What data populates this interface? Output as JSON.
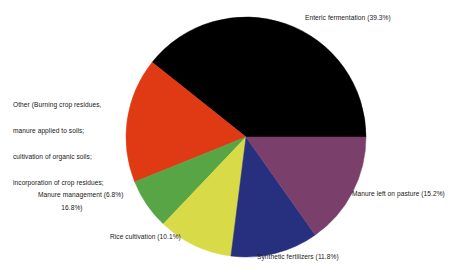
{
  "chart_data": {
    "type": "pie",
    "title": "",
    "subtitle": "",
    "xlabel": "",
    "ylabel": "",
    "legend_position": "none",
    "grid": false,
    "units": "percent",
    "start_angle_deg": 0,
    "direction": "counterclockwise",
    "categories": [
      "Enteric fermentation",
      "Other (Burning crop residues, manure applied to soils; cultivation of organic soils; incorporation of crop residues;",
      "Manure management",
      "Rice cultivation",
      "Synthetic fertilizers",
      "Manure left on pasture"
    ],
    "values": [
      39.3,
      16.8,
      6.8,
      10.1,
      11.8,
      15.2
    ],
    "colors": [
      "#000000",
      "#e03a14",
      "#57a544",
      "#d8db47",
      "#27307e",
      "#7b3f6b"
    ],
    "slices": [
      {
        "name": "enteric-fermentation",
        "label": "Enteric fermentation (39.3%)",
        "value": 39.3,
        "value_text": "39.3%",
        "color": "#000000"
      },
      {
        "name": "other",
        "label": "Other (Burning crop residues, manure applied to soils; cultivation of organic soils; incorporation of crop residues; 16.8%)",
        "value": 16.8,
        "value_text": "16.8%",
        "color": "#e03a14"
      },
      {
        "name": "manure-management",
        "label": "Manure management (6.8%)",
        "value": 6.8,
        "value_text": "6.8%",
        "color": "#57a544"
      },
      {
        "name": "rice-cultivation",
        "label": "Rice cultivation (10.1%)",
        "value": 10.1,
        "value_text": "10.1%",
        "color": "#d8db47"
      },
      {
        "name": "synthetic-fertilizers",
        "label": "Synthetic fertilizers (11.8%)",
        "value": 11.8,
        "value_text": "11.8%",
        "color": "#27307e"
      },
      {
        "name": "manure-left-on-pasture",
        "label": "Manure left on pasture (15.2%)",
        "value": 15.2,
        "value_text": "15.2%",
        "color": "#7b3f6b"
      }
    ]
  },
  "labels": {
    "enteric": "Enteric fermentation (39.3%)",
    "pasture": "Manure left on pasture (15.2%)",
    "synthetic": "Synthetic fertilizers (11.8%)",
    "rice": "Rice cultivation (10.1%)",
    "manure_management": "Manure management (6.8%)",
    "other_line1": "Other (Burning crop residues,",
    "other_line2": "manure applied to soils;",
    "other_line3": "cultivation of organic soils;",
    "other_line4": "incorporation of crop residues;",
    "other_line5": "16.8%)"
  },
  "geometry": {
    "center_x": 246,
    "center_y": 137,
    "radius": 120
  }
}
